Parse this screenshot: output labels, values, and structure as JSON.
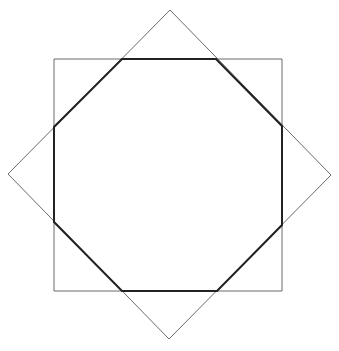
{
  "diagram": {
    "background": "#ffffff",
    "shapes": {
      "square": {
        "points": "54,59 282,59 282,291 54,291",
        "stroke": "#6b6b6b",
        "stroke_width": 1
      },
      "diamond": {
        "points": "170,10 331,175 169,339 8,174",
        "stroke": "#6b6b6b",
        "stroke_width": 1
      },
      "octagon": {
        "points": "122,59 216,59 282,126 282,225 217,291 122,291 54,222 54,127",
        "stroke": "#222222",
        "stroke_width": 2
      }
    }
  }
}
